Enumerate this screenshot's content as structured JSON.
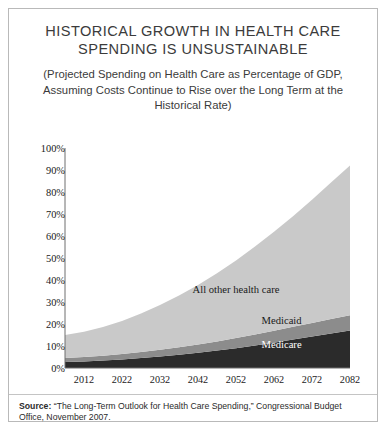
{
  "title": "HISTORICAL GROWTH IN HEALTH CARE SPENDING IS UNSUSTAINABLE",
  "subtitle": "(Projected Spending on Health Care as Percentage of GDP, Assuming Costs Continue to Rise over the Long Term at the Historical Rate)",
  "source": {
    "label": "Source:",
    "text": " “The Long-Term Outlook for Health Care Spending,” Congressional Budget Office, November 2007."
  },
  "colors": {
    "medicare": "#2b2b2b",
    "medicaid": "#8c8c8c",
    "all_other": "#c9c9c9",
    "axis": "#6f6f6f",
    "border": "#b9b9b9",
    "text": "#231f20"
  },
  "chart_data": {
    "type": "area",
    "title": "HISTORICAL GROWTH IN HEALTH CARE SPENDING IS UNSUSTAINABLE",
    "subtitle": "(Projected Spending on Health Care as Percentage of GDP, Assuming Costs Continue to Rise over the Long Term at the Historical Rate)",
    "xlabel": "",
    "ylabel": "",
    "stacked": true,
    "grid": false,
    "legend": "inline-labels",
    "xlim": [
      2007,
      2082
    ],
    "ylim": [
      0,
      100
    ],
    "ytick_labels": [
      "0%",
      "10%",
      "20%",
      "30%",
      "40%",
      "50%",
      "60%",
      "70%",
      "80%",
      "90%",
      "100%"
    ],
    "ytick_values": [
      0,
      10,
      20,
      30,
      40,
      50,
      60,
      70,
      80,
      90,
      100
    ],
    "xtick_labels": [
      "2012",
      "2022",
      "2032",
      "2042",
      "2052",
      "2062",
      "2072",
      "2082"
    ],
    "xtick_values": [
      2012,
      2022,
      2032,
      2042,
      2052,
      2062,
      2072,
      2082
    ],
    "x": [
      2007,
      2012,
      2017,
      2022,
      2027,
      2032,
      2037,
      2042,
      2047,
      2052,
      2057,
      2062,
      2067,
      2072,
      2077,
      2082
    ],
    "series": [
      {
        "name": "Medicare",
        "color": "#2b2b2b",
        "label_color": "#ffffff",
        "values": [
          2.7,
          3.0,
          3.4,
          3.9,
          4.5,
          5.2,
          6.0,
          6.9,
          7.9,
          9.0,
          10.2,
          11.5,
          12.9,
          14.3,
          15.7,
          17.0
        ]
      },
      {
        "name": "Medicaid",
        "color": "#8c8c8c",
        "label_color": "#1a1a1a",
        "values": [
          1.8,
          2.0,
          2.2,
          2.5,
          2.8,
          3.1,
          3.4,
          3.8,
          4.2,
          4.6,
          5.0,
          5.4,
          5.8,
          6.2,
          6.6,
          7.0
        ]
      },
      {
        "name": "All other health care",
        "color": "#c9c9c9",
        "label_color": "#1a1a1a",
        "values": [
          10.5,
          11.5,
          13.0,
          15.0,
          17.5,
          20.3,
          23.5,
          27.0,
          31.0,
          35.3,
          40.0,
          45.0,
          50.3,
          56.0,
          62.0,
          68.0
        ]
      }
    ],
    "totals": [
      15.0,
      16.5,
      18.6,
      21.4,
      24.8,
      28.6,
      32.9,
      37.7,
      43.1,
      48.9,
      55.2,
      61.9,
      69.0,
      76.5,
      84.3,
      92.0
    ],
    "annotations": [
      {
        "text": "All other health care",
        "x": 2052,
        "y": 36
      },
      {
        "text": "Medicaid",
        "x": 2064,
        "y": 22
      },
      {
        "text": "Medicare",
        "x": 2064,
        "y": 11
      }
    ]
  }
}
